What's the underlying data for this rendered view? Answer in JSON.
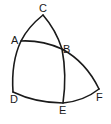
{
  "diagram": {
    "type": "spherical-geometry-figure",
    "stroke_color": "#1a1a1a",
    "background": "#ffffff",
    "points": [
      {
        "id": "C",
        "label": "C",
        "x": 43,
        "y": 15,
        "label_x": 39,
        "label_y": 12
      },
      {
        "id": "A",
        "label": "A",
        "x": 21,
        "y": 41,
        "label_x": 11,
        "label_y": 44
      },
      {
        "id": "B",
        "label": "B",
        "x": 62,
        "y": 49,
        "label_x": 63,
        "label_y": 53
      },
      {
        "id": "D",
        "label": "D",
        "x": 13,
        "y": 92,
        "label_x": 10,
        "label_y": 103
      },
      {
        "id": "E",
        "label": "E",
        "x": 63,
        "y": 103,
        "label_x": 59,
        "label_y": 114
      },
      {
        "id": "F",
        "label": "F",
        "x": 99,
        "y": 89,
        "label_x": 96,
        "label_y": 101
      }
    ],
    "arcs": [
      {
        "id": "arc-CAD",
        "through": [
          "C",
          "A",
          "D"
        ]
      },
      {
        "id": "arc-CBE",
        "through": [
          "C",
          "B",
          "E"
        ]
      },
      {
        "id": "arc-ABF",
        "through": [
          "A",
          "B",
          "F"
        ]
      },
      {
        "id": "arc-DEF",
        "through": [
          "D",
          "E",
          "F"
        ]
      }
    ]
  }
}
